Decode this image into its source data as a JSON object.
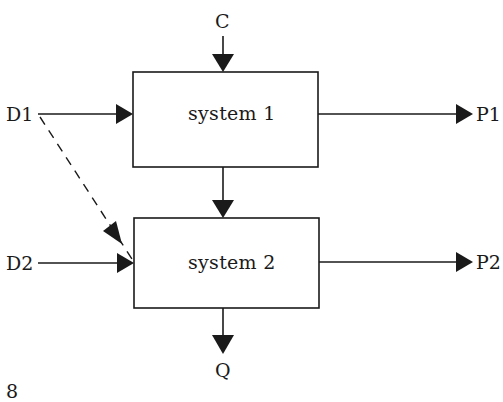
{
  "diagram": {
    "type": "block-diagram",
    "nodes": [
      {
        "id": "system1",
        "label": "system 1"
      },
      {
        "id": "system2",
        "label": "system 2"
      }
    ],
    "inputs": {
      "c": "C",
      "d1": "D1",
      "d2": "D2"
    },
    "outputs": {
      "p1": "P1",
      "p2": "P2",
      "q": "Q"
    },
    "edges": [
      {
        "from": "C",
        "to": "system 1",
        "style": "solid"
      },
      {
        "from": "D1",
        "to": "system 1",
        "style": "solid"
      },
      {
        "from": "D1",
        "to": "system 2",
        "style": "dashed"
      },
      {
        "from": "system 1",
        "to": "system 2",
        "style": "solid"
      },
      {
        "from": "system 1",
        "to": "P1",
        "style": "solid"
      },
      {
        "from": "D2",
        "to": "system 2",
        "style": "solid"
      },
      {
        "from": "system 2",
        "to": "P2",
        "style": "solid"
      },
      {
        "from": "system 2",
        "to": "Q",
        "style": "solid"
      }
    ],
    "page_number": "8",
    "colors": {
      "line": "#1a1a1a",
      "background": "#ffffff"
    }
  }
}
